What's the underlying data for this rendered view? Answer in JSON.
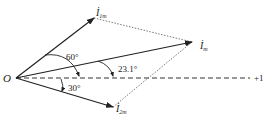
{
  "diagram": {
    "type": "phasor-diagram",
    "origin_label": "O",
    "axis_label": "+1",
    "phasors": [
      {
        "name": "I1m",
        "label_main": "İ",
        "label_sub": "1m",
        "angle_deg": 30
      },
      {
        "name": "Im",
        "label_main": "İ",
        "label_sub": "m",
        "angle_deg": 23.1
      },
      {
        "name": "I2m",
        "label_main": "İ",
        "label_sub": "2m",
        "angle_deg": -30
      }
    ],
    "angle_labels": {
      "a60": "60°",
      "a23": "23.1°",
      "a30": "30°"
    },
    "colors": {
      "line": "#222222",
      "dotted": "#555555"
    }
  }
}
